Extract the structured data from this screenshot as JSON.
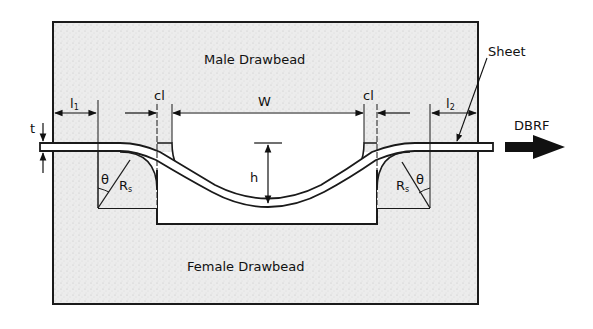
{
  "diagram": {
    "labels": {
      "male": "Male Drawbead",
      "female": "Female Drawbead",
      "sheet": "Sheet",
      "force": "DBRF",
      "thickness": "t",
      "l1_main": "l",
      "l1_sub": "1",
      "l2_main": "l",
      "l2_sub": "2",
      "clearance_left": "cl",
      "clearance_right": "cl",
      "width": "W",
      "height": "h",
      "theta_left": "θ",
      "theta_right": "θ",
      "radius_left_main": "R",
      "radius_left_sub": "s",
      "radius_right_main": "R",
      "radius_right_sub": "s"
    },
    "colors": {
      "fill": "#e9e9e9",
      "stroke": "#1a1a1a",
      "groove": "#ffffff"
    }
  }
}
